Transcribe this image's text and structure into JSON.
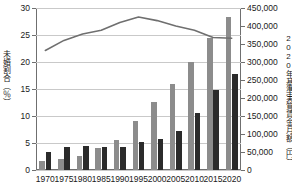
{
  "chart_data": {
    "type": "bar",
    "title": "",
    "xlabel": "",
    "categories": [
      "1970",
      "1975",
      "1980",
      "1985",
      "1990",
      "1995",
      "2000",
      "2005",
      "2010",
      "2015",
      "2020"
    ],
    "left_axis": {
      "label": "未婚割合（％）",
      "ylim": [
        0,
        30
      ],
      "ticks": [
        "0",
        "5",
        "10",
        "15",
        "20",
        "25",
        "30"
      ],
      "tick_values": [
        0,
        5,
        10,
        15,
        20,
        25,
        30
      ],
      "grid": true
    },
    "right_axis": {
      "label": "2020年基準実質賃金月額（円）",
      "ylim": [
        0,
        450000
      ],
      "ticks": [
        "0",
        "50,000",
        "100,000",
        "150,000",
        "200,000",
        "250,000",
        "300,000",
        "350,000",
        "400,000",
        "450,000"
      ],
      "tick_values": [
        0,
        50000,
        100000,
        150000,
        200000,
        250000,
        300000,
        350000,
        400000,
        450000
      ],
      "grid": false
    },
    "series": [
      {
        "name": "男性未婚割合",
        "type": "bar",
        "axis": "left",
        "color": "#8c8c8c",
        "values": [
          1.7,
          2.1,
          2.6,
          4.0,
          5.6,
          9.0,
          12.6,
          16.0,
          20.0,
          24.5,
          28.3
        ]
      },
      {
        "name": "女性未婚割合",
        "type": "bar",
        "axis": "left",
        "color": "#2b2b2b",
        "values": [
          3.3,
          4.3,
          4.5,
          4.3,
          4.3,
          5.1,
          5.8,
          7.3,
          10.6,
          14.9,
          17.8
        ]
      },
      {
        "name": "2020年基準実質賃金月額",
        "type": "line",
        "axis": "right",
        "color": "#6f6f6f",
        "values": [
          332000,
          360000,
          378000,
          388000,
          410000,
          425000,
          415000,
          400000,
          388000,
          368000,
          366000
        ]
      }
    ],
    "legend": {
      "position": "none",
      "entries": []
    },
    "caption": ""
  }
}
